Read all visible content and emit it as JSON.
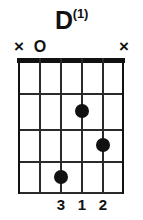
{
  "title": {
    "root": "D",
    "variant": "(1)",
    "full": "D(1)"
  },
  "chord_data": {
    "type": "chord-diagram",
    "instrument": "guitar",
    "name": "D(1)",
    "strings": 6,
    "frets": 4,
    "base_fret": 1,
    "string_markers": [
      "x",
      "o",
      "",
      "",
      "",
      "x"
    ],
    "string_marker_labels": {
      "mute": "×",
      "open": "O"
    },
    "positions": [
      {
        "string": 1,
        "fret": 0,
        "marker": "x",
        "finger": ""
      },
      {
        "string": 2,
        "fret": 0,
        "marker": "o",
        "finger": ""
      },
      {
        "string": 3,
        "fret": 4,
        "marker": "",
        "finger": "3"
      },
      {
        "string": 4,
        "fret": 2,
        "marker": "",
        "finger": "1"
      },
      {
        "string": 5,
        "fret": 3,
        "marker": "",
        "finger": "2"
      },
      {
        "string": 6,
        "fret": 0,
        "marker": "x",
        "finger": ""
      }
    ],
    "dots": [
      {
        "string": 4,
        "fret": 2,
        "finger": "1"
      },
      {
        "string": 5,
        "fret": 3,
        "finger": "2"
      },
      {
        "string": 3,
        "fret": 4,
        "finger": "3"
      }
    ],
    "fingering": [
      "",
      "",
      "3",
      "1",
      "2",
      ""
    ],
    "colors": {
      "ink": "#111111",
      "grid": "#2a2a2a",
      "background": "#ffffff"
    }
  }
}
